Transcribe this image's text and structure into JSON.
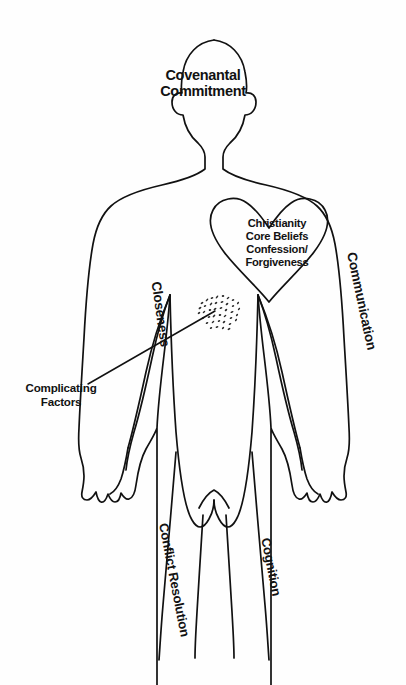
{
  "diagram": {
    "type": "annotated-human-figure",
    "title_region": "body-map",
    "line_color": "#111111",
    "background_color": "#ffffff",
    "text_color": "#121212"
  },
  "labels": {
    "head": "Covenantal\nCommitment",
    "heart": "Christianity\nCore Beliefs\nConfession/\nForgiveness",
    "left_arm": "Closeness",
    "right_arm": "Communication",
    "left_leg": "Conflict Resolution",
    "right_leg": "Cognition",
    "callout": "Complicating\nFactors"
  },
  "parts": {
    "head_region": "head",
    "heart_region": "heart",
    "left_arm_region": "left-arm",
    "right_arm_region": "right-arm",
    "left_leg_region": "left-leg",
    "right_leg_region": "right-leg",
    "speckle_cluster": "complicating-factors-speckles",
    "leader_line": "callout-leader-line"
  }
}
